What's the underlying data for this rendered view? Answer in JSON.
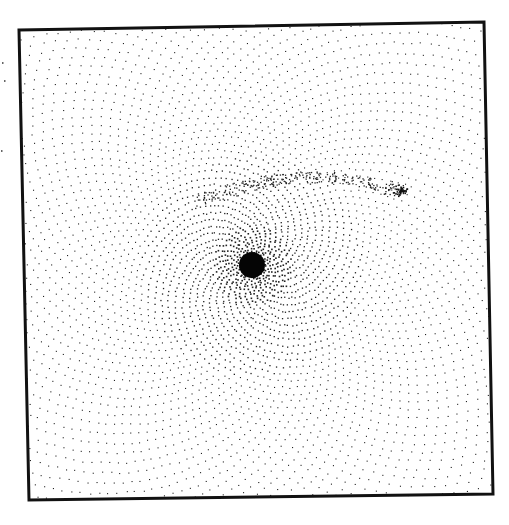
{
  "figure": {
    "frame": {
      "corners": [
        [
          19,
          30
        ],
        [
          484,
          22
        ],
        [
          493,
          494
        ],
        [
          29,
          500
        ]
      ],
      "stroke_color": "#111111",
      "stroke_width": 3
    },
    "nucleus": {
      "x": 252,
      "y": 265,
      "radius": 13
    },
    "satellite": {
      "x": 400,
      "y": 190,
      "radius": 6
    },
    "dot_color": "#222222",
    "background": "#ffffff",
    "margin_marks": [
      [
        2,
        62
      ],
      [
        4,
        80
      ],
      [
        1,
        150
      ]
    ]
  }
}
